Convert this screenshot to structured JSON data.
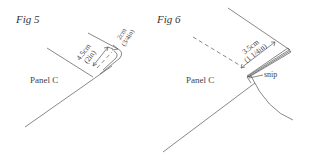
{
  "figures": [
    {
      "title": "Fig 5",
      "panel_label": "Panel C",
      "dimensions": [
        {
          "metric": "4.5cm",
          "imperial": "(2in)"
        },
        {
          "metric": "2cm",
          "imperial": "(3/4in)"
        }
      ]
    },
    {
      "title": "Fig 6",
      "panel_label": "Panel C",
      "dimensions": [
        {
          "metric": "3.5cm",
          "imperial": "(1 1/4in)"
        }
      ],
      "annotation": "snip"
    }
  ],
  "colors": {
    "line": "#555555",
    "text": "#444444",
    "background": "#ffffff"
  }
}
